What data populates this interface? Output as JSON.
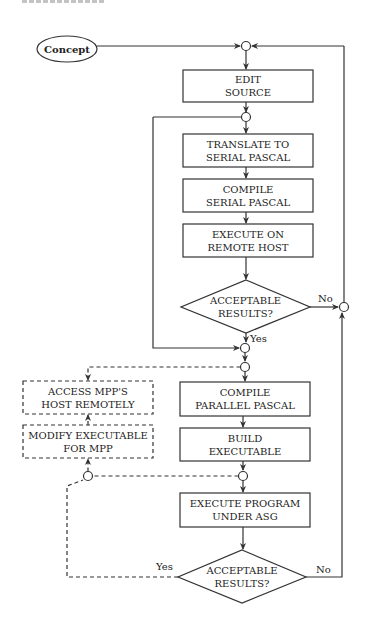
{
  "diagram": {
    "type": "flowchart",
    "colors": {
      "stroke": "#333333",
      "text": "#222222",
      "background": "#ffffff"
    },
    "nodes": {
      "concept": {
        "label": "Concept",
        "shape": "ellipse"
      },
      "edit_source": {
        "line1": "EDIT",
        "line2": "SOURCE",
        "shape": "box"
      },
      "translate": {
        "line1": "TRANSLATE TO",
        "line2": "SERIAL PASCAL",
        "shape": "box"
      },
      "compile_serial": {
        "line1": "COMPILE",
        "line2": "SERIAL PASCAL",
        "shape": "box"
      },
      "execute_remote": {
        "line1": "EXECUTE ON",
        "line2": "REMOTE HOST",
        "shape": "box"
      },
      "decision1": {
        "line1": "ACCEPTABLE",
        "line2": "RESULTS?",
        "shape": "diamond"
      },
      "access_mpp": {
        "line1": "ACCESS MPP'S",
        "line2": "HOST REMOTELY",
        "shape": "dashed-box"
      },
      "modify_exec": {
        "line1": "MODIFY EXECUTABLE",
        "line2": "FOR MPP",
        "shape": "dashed-box"
      },
      "compile_parallel": {
        "line1": "COMPILE",
        "line2": "PARALLEL PASCAL",
        "shape": "box"
      },
      "build_exec": {
        "line1": "BUILD",
        "line2": "EXECUTABLE",
        "shape": "box"
      },
      "execute_asg": {
        "line1": "EXECUTE PROGRAM",
        "line2": "UNDER ASG",
        "shape": "box"
      },
      "decision2": {
        "line1": "ACCEPTABLE",
        "line2": "RESULTS?",
        "shape": "diamond"
      }
    },
    "edge_labels": {
      "d1_no": "No",
      "d1_yes": "Yes",
      "d2_yes": "Yes",
      "d2_no": "No"
    }
  }
}
